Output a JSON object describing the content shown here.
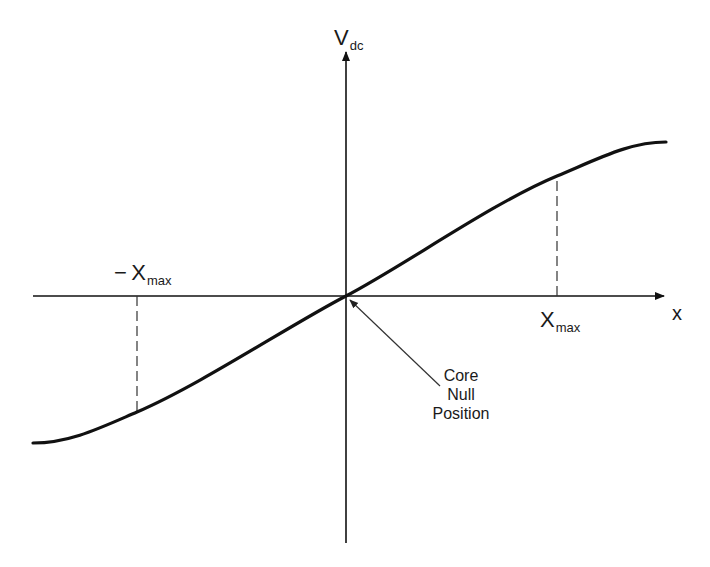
{
  "diagram": {
    "title": "",
    "axes": {
      "y_axis": {
        "label_main": "V",
        "label_sub": "dc"
      },
      "x_axis": {
        "label": "x"
      }
    },
    "markers": {
      "neg_xmax": {
        "prefix": "−",
        "main": "X",
        "sub": "max"
      },
      "pos_xmax": {
        "main": "X",
        "sub": "max"
      }
    },
    "annotation": {
      "lines": [
        "Core",
        "Null",
        "Position"
      ]
    },
    "colors": {
      "line": "#111111",
      "background": "#ffffff",
      "arrow_thin": "#444444"
    }
  }
}
